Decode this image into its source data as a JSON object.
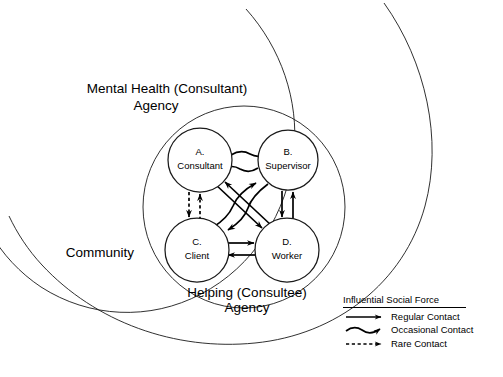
{
  "figure": {
    "zones": [
      {
        "id": "community",
        "label": "Community",
        "shape": "arc"
      },
      {
        "id": "mental_health_agency",
        "label_line1": "Mental Health (Consultant)",
        "label_line2": "Agency",
        "shape": "circle"
      },
      {
        "id": "helping_agency",
        "label_line1": "Helping (Consultee)",
        "label_line2": "Agency",
        "shape": "circle"
      }
    ],
    "nodes": [
      {
        "id": "A",
        "letter": "A.",
        "name": "Consultant",
        "cx": 200,
        "cy": 160,
        "r": 32
      },
      {
        "id": "B",
        "letter": "B.",
        "name": "Supervisor",
        "cx": 288,
        "cy": 160,
        "r": 30
      },
      {
        "id": "C",
        "letter": "C.",
        "name": "Client",
        "cx": 197,
        "cy": 250,
        "r": 32
      },
      {
        "id": "D",
        "letter": "D.",
        "name": "Worker",
        "cx": 287,
        "cy": 250,
        "r": 32
      }
    ],
    "edges": [
      {
        "from": "A",
        "to": "B",
        "contact": "occasional",
        "bidirectional": true
      },
      {
        "from": "A",
        "to": "C",
        "contact": "rare",
        "bidirectional": true
      },
      {
        "from": "B",
        "to": "D",
        "contact": "regular",
        "bidirectional": true
      },
      {
        "from": "C",
        "to": "D",
        "contact": "regular",
        "bidirectional": true
      },
      {
        "from": "A",
        "to": "D",
        "contact": "regular",
        "bidirectional": true
      },
      {
        "from": "B",
        "to": "C",
        "contact": "occasional",
        "bidirectional": true
      }
    ],
    "legend": {
      "title": "Influential Social Force",
      "items": [
        {
          "key": "regular",
          "style": "solid",
          "label": "Regular Contact"
        },
        {
          "key": "occasional",
          "style": "wavy",
          "label": "Occasional Contact"
        },
        {
          "key": "rare",
          "style": "dashed",
          "label": "Rare Contact"
        }
      ]
    },
    "colors": {
      "ink": "#1a1a1a",
      "stroke": "#000000",
      "background": "#ffffff"
    }
  }
}
